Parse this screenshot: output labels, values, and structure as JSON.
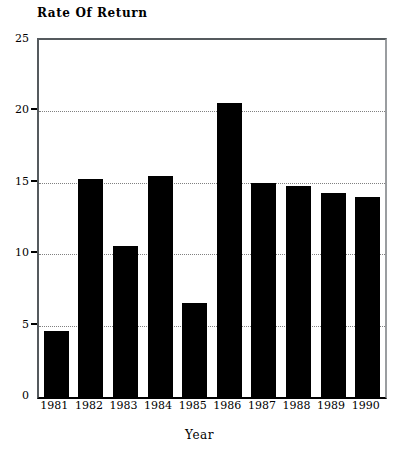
{
  "chart_data": {
    "type": "bar",
    "title": "Rate Of Return",
    "xlabel": "Year",
    "ylabel": "",
    "categories": [
      "1981",
      "1982",
      "1983",
      "1984",
      "1985",
      "1986",
      "1987",
      "1988",
      "1989",
      "1990"
    ],
    "values": [
      4.6,
      15.3,
      10.6,
      15.5,
      6.6,
      20.6,
      15.0,
      14.8,
      14.3,
      14.0
    ],
    "ylim": [
      0,
      25
    ],
    "y_ticks": [
      0,
      5,
      10,
      15,
      20,
      25
    ],
    "y_tick_labels": [
      "0",
      "5",
      "10",
      "15",
      "20",
      "25"
    ],
    "grid": true,
    "grid_axis": "y",
    "legend": false,
    "bar_color": "#000000",
    "grid_color": "#808080",
    "axis_color": "#000000",
    "background_color": "#ffffff"
  },
  "axes": {
    "y": {
      "labels": [
        "25",
        "20",
        "15",
        "10",
        "5",
        "0"
      ],
      "values": [
        25,
        20,
        15,
        10,
        5,
        0
      ]
    },
    "x": {
      "labels": [
        "1981",
        "1982",
        "1983",
        "1984",
        "1985",
        "1986",
        "1987",
        "1988",
        "1989",
        "1990"
      ],
      "title": "Year"
    }
  },
  "title": "Rate Of Return"
}
